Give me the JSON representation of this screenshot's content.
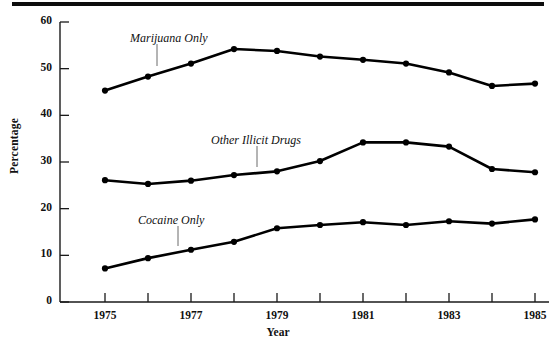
{
  "chart_data": {
    "type": "line",
    "title": "",
    "xlabel": "Year",
    "ylabel": "Percentage",
    "x": [
      1975,
      1976,
      1977,
      1978,
      1979,
      1980,
      1981,
      1982,
      1983,
      1984,
      1985
    ],
    "categories": [
      "1975",
      "1976",
      "1977",
      "1978",
      "1979",
      "1980",
      "1981",
      "1982",
      "1983",
      "1984",
      "1985"
    ],
    "xlim": [
      1975,
      1985
    ],
    "ylim": [
      0,
      60
    ],
    "ytick_values": [
      0,
      10,
      20,
      30,
      40,
      50,
      60
    ],
    "ytick_labels": [
      "0",
      "10",
      "20",
      "30",
      "40",
      "50",
      "60"
    ],
    "xtick_values": [
      1975,
      1976,
      1977,
      1978,
      1979,
      1980,
      1981,
      1982,
      1983,
      1984,
      1985
    ],
    "xtick_labels_shown": [
      "1975",
      "",
      "1977",
      "",
      "1979",
      "",
      "1981",
      "",
      "1983",
      "",
      "1985"
    ],
    "grid": false,
    "legend_position": "inline-annotations",
    "marker": "filled-circle",
    "line_color": "#000000",
    "series": [
      {
        "name": "Marijuana Only",
        "values": [
          45.3,
          48.3,
          51.1,
          54.2,
          53.8,
          52.6,
          51.9,
          51.1,
          49.2,
          46.3,
          46.8
        ]
      },
      {
        "name": "Other Illicit Drugs",
        "values": [
          26.1,
          25.3,
          26.0,
          27.2,
          28.0,
          30.2,
          34.2,
          34.2,
          33.3,
          28.5,
          27.8
        ]
      },
      {
        "name": "Cocaine Only",
        "values": [
          7.2,
          9.4,
          11.2,
          12.9,
          15.8,
          16.5,
          17.1,
          16.5,
          17.3,
          16.8,
          17.7
        ]
      }
    ],
    "annotations": [
      {
        "text": "Marijuana Only",
        "series": "Marijuana Only",
        "x_px": 130,
        "y_px": 31,
        "leader_x": 157,
        "leader_y1": 44,
        "leader_y2": 66
      },
      {
        "text": "Other Illicit Drugs",
        "series": "Other Illicit Drugs",
        "x_px": 211,
        "y_px": 133,
        "leader_x": 257,
        "leader_y1": 146,
        "leader_y2": 167
      },
      {
        "text": "Cocaine Only",
        "series": "Cocaine Only",
        "x_px": 138,
        "y_px": 213,
        "leader_x": 178,
        "leader_y1": 226,
        "leader_y2": 246
      }
    ]
  },
  "axes": {
    "ylabel": "Percentage",
    "xlabel": "Year"
  }
}
